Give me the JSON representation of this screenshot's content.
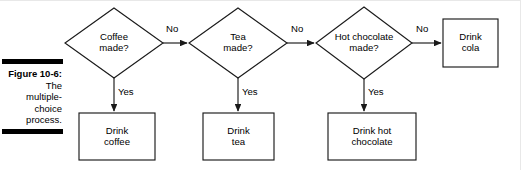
{
  "figure": {
    "caption_title": "Figure 10-6:",
    "caption_lines": [
      "The",
      "multiple-",
      "choice",
      "process."
    ]
  },
  "colors": {
    "stroke": "#1a1a1a",
    "rule": "#000000",
    "background": "#ffffff"
  },
  "diagram": {
    "type": "flowchart",
    "decisions": [
      {
        "id": "coffee",
        "line1": "Coffee",
        "line2": "made?"
      },
      {
        "id": "tea",
        "line1": "Tea",
        "line2": "made?"
      },
      {
        "id": "hot-chocolate",
        "line1": "Hot chocolate",
        "line2": "made?"
      }
    ],
    "outcomes": [
      {
        "id": "drink-coffee",
        "line1": "Drink",
        "line2": "coffee"
      },
      {
        "id": "drink-tea",
        "line1": "Drink",
        "line2": "tea"
      },
      {
        "id": "drink-hot-chocolate",
        "line1": "Drink hot",
        "line2": "chocolate"
      },
      {
        "id": "drink-cola",
        "line1": "Drink",
        "line2": "cola"
      }
    ],
    "edge_labels": {
      "no_1": "No",
      "no_2": "No",
      "no_3": "No",
      "yes_1": "Yes",
      "yes_2": "Yes",
      "yes_3": "Yes"
    }
  }
}
